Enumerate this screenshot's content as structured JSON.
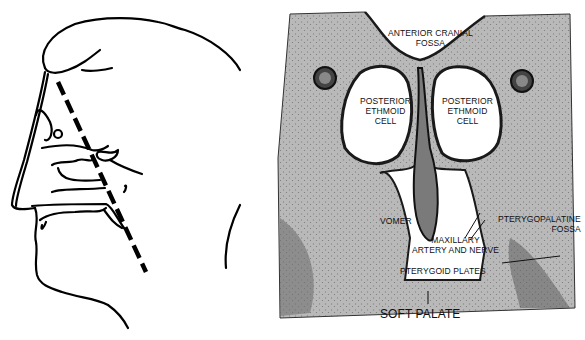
{
  "figure": {
    "left_panel": {
      "description": "Sagittal line drawing of head with dashed coronal section plane",
      "section_line": "dashed"
    },
    "right_panel": {
      "description": "Coronal histological section through posterior ethmoid region",
      "labels": {
        "anterior_cranial_fossa": [
          "ANTERIOR CRANIAL",
          "FOSSA"
        ],
        "posterior_ethmoid_left": [
          "POSTERIOR",
          "ETHMOID",
          "CELL"
        ],
        "posterior_ethmoid_right": [
          "POSTERIOR",
          "ETHMOID",
          "CELL"
        ],
        "vomer": "VOMER",
        "pterygopalatine_fossa": [
          "PTERYGOPALATINE",
          "FOSSA"
        ],
        "maxillary_artery": [
          "MAXILLARY",
          "ARTERY AND NERVE"
        ],
        "pterygoid_plates": "PTERYGOID PLATES",
        "soft_palate": "SOFT PALATE"
      }
    },
    "colors": {
      "line": "#000000",
      "tissue": "#b8b8b8",
      "tissue_dark": "#3a3a3a",
      "airspace": "#ffffff",
      "background": "#ffffff"
    }
  }
}
